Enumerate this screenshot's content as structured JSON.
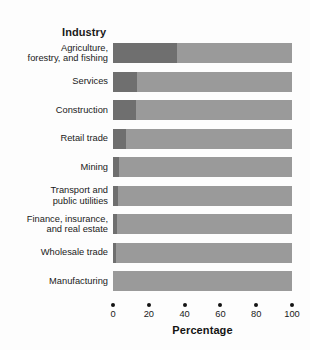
{
  "figure": {
    "legend_heading": "Industry",
    "background_color": "#fdfdfd"
  },
  "chart_data": {
    "type": "bar",
    "orientation": "horizontal",
    "stacked": true,
    "title": "",
    "subtitle": "",
    "xlabel": "Percentage",
    "ylabel": "Industry",
    "xlim": [
      0,
      100
    ],
    "xticks": [
      0,
      20,
      40,
      60,
      80,
      100
    ],
    "xticklabels": [
      "0",
      "20",
      "40",
      "60",
      "80",
      "100"
    ],
    "grid": false,
    "legend_position": "none",
    "categories": [
      "Agriculture, forestry, and fishing",
      "Services",
      "Construction",
      "Retail trade",
      "Mining",
      "Transport and public utilities",
      "Finance, insurance, and real estate",
      "Wholesale trade",
      "Manufacturing"
    ],
    "category_label_lines": [
      [
        "Agriculture,",
        "forestry, and fishing"
      ],
      [
        "Services"
      ],
      [
        "Construction"
      ],
      [
        "Retail trade"
      ],
      [
        "Mining"
      ],
      [
        "Transport and",
        "public utilities"
      ],
      [
        "Finance, insurance,",
        "and real estate"
      ],
      [
        "Wholesale trade"
      ],
      [
        "Manufacturing"
      ]
    ],
    "series": [
      {
        "name": "dark-segment",
        "color": "#6f6f6f",
        "values": [
          36,
          13.5,
          13,
          7.3,
          3.5,
          3,
          2.5,
          1.5,
          0
        ]
      },
      {
        "name": "light-segment",
        "color": "#9a9a9a",
        "values": [
          64,
          86.5,
          87,
          92.7,
          96.5,
          97,
          97.5,
          98.5,
          100
        ]
      }
    ],
    "annotations": []
  }
}
